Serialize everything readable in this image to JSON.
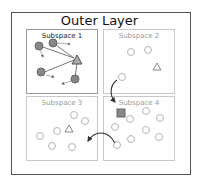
{
  "outer": {
    "title": "Outer Layer"
  },
  "subspaces": [
    {
      "title": "Subspace 1",
      "active": true
    },
    {
      "title": "Subspace 2",
      "active": false
    },
    {
      "title": "Subspace 3",
      "active": false
    },
    {
      "title": "Subspace 4",
      "active": false
    }
  ],
  "colors": {
    "active_node_fill": "#888888",
    "active_node_stroke": "#666666",
    "inactive_node_stroke": "#b5b5b5",
    "square_fill": "#888888",
    "arrow": "#333333"
  },
  "legend_shapes": [
    "circle-node",
    "triangle-node",
    "square-node"
  ]
}
